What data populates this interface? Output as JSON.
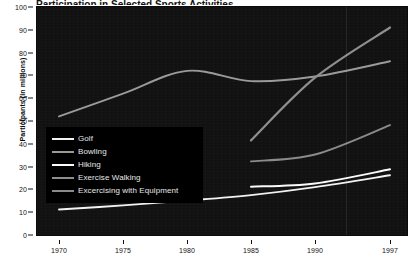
{
  "chart_data": {
    "type": "line",
    "title": "Participation in Selected Sports Activities",
    "xlabel": "",
    "ylabel": "Participants (in millions)",
    "x_ticks": [
      "1970",
      "1975",
      "1980",
      "1985",
      "1990",
      "1997"
    ],
    "y_ticks": [
      "0",
      "10",
      "20",
      "30",
      "40",
      "50",
      "60",
      "70",
      "80",
      "90",
      "100"
    ],
    "ylim": [
      0,
      100
    ],
    "xlim": [
      1968,
      1999
    ],
    "grid": "vertical-faint",
    "legend_position": "center-left-overlay",
    "background": "#111111",
    "page_background": "#ffffff",
    "series": [
      {
        "name": "Golf",
        "color": "#f2f2f2",
        "x": [
          1970,
          1975,
          1980,
          1985,
          1990,
          1997
        ],
        "values": [
          11.2,
          13.0,
          15.1,
          17.5,
          21.0,
          26.2
        ]
      },
      {
        "name": "Bowling",
        "color": "#9a9a9a",
        "x": [
          1970,
          1975,
          1980,
          1985,
          1990,
          1997
        ],
        "values": [
          52.0,
          62.0,
          72.0,
          67.5,
          69.5,
          76.2
        ]
      },
      {
        "name": "Hiking",
        "color": "#fbfbfb",
        "x": [
          1985,
          1990,
          1997
        ],
        "values": [
          21.2,
          22.6,
          28.8
        ]
      },
      {
        "name": "Exercise Walking",
        "color": "#8e8e8e",
        "x": [
          1985,
          1990,
          1997
        ],
        "values": [
          41.5,
          69.0,
          91.0
        ]
      },
      {
        "name": "Excercising with Equipment",
        "color": "#8a8a8a",
        "x": [
          1985,
          1990,
          1997
        ],
        "values": [
          32.3,
          35.3,
          48.2
        ]
      }
    ]
  },
  "legend": {
    "items": [
      {
        "label": "Golf",
        "color": "#f2f2f2"
      },
      {
        "label": "Bowling",
        "color": "#9a9a9a"
      },
      {
        "label": "Hiking",
        "color": "#fbfbfb"
      },
      {
        "label": "Exercise Walking",
        "color": "#8e8e8e"
      },
      {
        "label": "Excercising with Equipment",
        "color": "#8a8a8a"
      }
    ]
  }
}
